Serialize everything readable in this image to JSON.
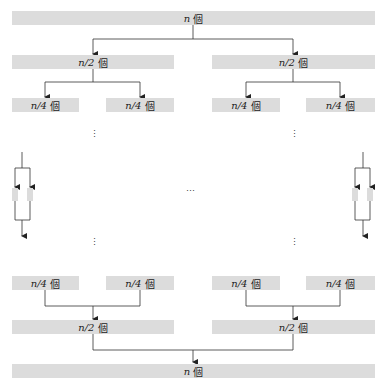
{
  "diagram": {
    "type": "divide-and-conquer",
    "top": {
      "var": "n",
      "unit": "個"
    },
    "levels": {
      "half": {
        "var": "n/2",
        "unit": "個"
      },
      "quarter": {
        "var": "n/4",
        "unit": "個"
      }
    },
    "bottom": {
      "var": "n",
      "unit": "個"
    },
    "ellipsis_vertical": "⋮",
    "ellipsis_horizontal": "⋯"
  }
}
